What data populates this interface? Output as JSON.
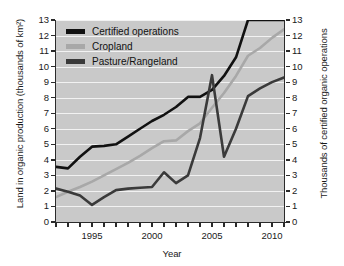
{
  "chart_data": {
    "type": "line",
    "title": "",
    "xlabel": "Year",
    "ylabel": "Land in organic production (thousands of km²)",
    "ylabel_right": "Thousands of certified organic operations",
    "xlim": [
      1992,
      2011
    ],
    "ylim": [
      0,
      13
    ],
    "xticks": [
      1995,
      2000,
      2005,
      2010
    ],
    "xticks_minor": [
      1992,
      1993,
      1994,
      1996,
      1997,
      1998,
      1999,
      2001,
      2002,
      2003,
      2004,
      2006,
      2007,
      2008,
      2009,
      2011
    ],
    "yticks": [
      0,
      1,
      2,
      3,
      4,
      5,
      6,
      7,
      8,
      9,
      10,
      11,
      12,
      13
    ],
    "yticks_right": [
      0,
      1,
      2,
      3,
      4,
      5,
      6,
      7,
      8,
      9,
      10,
      11,
      12,
      13
    ],
    "grid": true,
    "grid_color": "#f2f2f2",
    "plot_background": "#c9c9c9",
    "legend_position": "top-left",
    "x": [
      1992,
      1993,
      1994,
      1995,
      1996,
      1997,
      1998,
      1999,
      2000,
      2001,
      2002,
      2003,
      2004,
      2005,
      2006,
      2007,
      2008,
      2009,
      2010,
      2011
    ],
    "series": [
      {
        "name": "Certified operations",
        "color": "#111111",
        "axis": "right",
        "values": [
          3.55,
          3.45,
          4.2,
          4.85,
          4.9,
          5.0,
          5.5,
          6.0,
          6.5,
          6.9,
          7.4,
          8.05,
          8.05,
          8.5,
          9.4,
          10.6,
          13.0,
          13.0,
          13.0,
          13.0
        ]
      },
      {
        "name": "Cropland",
        "color": "#a8a8a8",
        "axis": "left",
        "values": [
          1.6,
          1.95,
          2.25,
          2.6,
          3.0,
          3.4,
          3.8,
          4.25,
          4.75,
          5.2,
          5.25,
          5.85,
          6.35,
          7.35,
          8.3,
          9.4,
          10.7,
          11.2,
          11.85,
          12.4
        ]
      },
      {
        "name": "Pasture/Rangeland",
        "color": "#3a3a3a",
        "axis": "left",
        "values": [
          2.15,
          1.95,
          1.7,
          1.1,
          1.6,
          2.05,
          2.15,
          2.2,
          2.25,
          3.2,
          2.5,
          3.0,
          5.4,
          9.45,
          4.2,
          6.0,
          8.1,
          8.6,
          9.0,
          9.3
        ]
      }
    ]
  },
  "legend": {
    "items": [
      {
        "label": "Certified operations",
        "color": "#111111"
      },
      {
        "label": "Cropland",
        "color": "#a8a8a8"
      },
      {
        "label": "Pasture/Rangeland",
        "color": "#3a3a3a"
      }
    ]
  }
}
